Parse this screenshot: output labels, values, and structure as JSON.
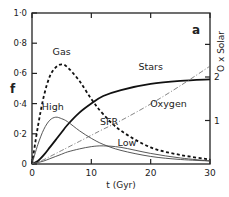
{
  "chart_data": {
    "type": "line",
    "panel_label": "a",
    "title": "",
    "xlabel": "t (Gyr)",
    "ylabel": "f",
    "y2label": "O x Solar",
    "xlim": [
      0,
      30
    ],
    "ylim": [
      0,
      1.0
    ],
    "y2lim": [
      0,
      3.2
    ],
    "x_ticks": [
      "0",
      "10",
      "20",
      "30"
    ],
    "y_ticks": [
      "0",
      "0·2",
      "0·4",
      "0·6",
      "0·8",
      "1·0"
    ],
    "y2_ticks": [
      "1",
      "2"
    ],
    "grid": false,
    "x": [
      0,
      1,
      2,
      3,
      4,
      5,
      6,
      8,
      10,
      12,
      15,
      20,
      25,
      30
    ],
    "series": [
      {
        "name": "Gas",
        "axis": "left",
        "style": "dashed-thick",
        "values": [
          0,
          0.25,
          0.45,
          0.58,
          0.64,
          0.66,
          0.64,
          0.55,
          0.43,
          0.33,
          0.22,
          0.11,
          0.06,
          0.03
        ]
      },
      {
        "name": "Stars",
        "axis": "left",
        "style": "solid-thick",
        "values": [
          0,
          0.02,
          0.06,
          0.11,
          0.16,
          0.21,
          0.26,
          0.34,
          0.4,
          0.45,
          0.49,
          0.53,
          0.55,
          0.56
        ]
      },
      {
        "name": "High",
        "axis": "left",
        "style": "solid-thin",
        "values": [
          0,
          0.13,
          0.23,
          0.29,
          0.31,
          0.3,
          0.28,
          0.22,
          0.17,
          0.13,
          0.09,
          0.05,
          0.03,
          0.02
        ]
      },
      {
        "name": "Low",
        "axis": "left",
        "style": "solid-thin",
        "values": [
          0,
          0.01,
          0.02,
          0.035,
          0.05,
          0.065,
          0.08,
          0.1,
          0.115,
          0.12,
          0.11,
          0.07,
          0.04,
          0.02
        ]
      },
      {
        "name": "Oxygen",
        "axis": "right",
        "style": "dash-dot",
        "values": [
          0,
          0.05,
          0.1,
          0.17,
          0.24,
          0.31,
          0.38,
          0.52,
          0.66,
          0.8,
          1.0,
          1.38,
          1.8,
          2.25
        ]
      }
    ],
    "annotations": [
      {
        "text": "Gas",
        "x": 5,
        "y": 0.72
      },
      {
        "text": "Stars",
        "x": 20,
        "y": 0.62
      },
      {
        "text": "Oxygen",
        "x": 23,
        "y": 0.38
      },
      {
        "text": "High",
        "x": 3.5,
        "y": 0.36
      },
      {
        "text": "SFR",
        "x": 13,
        "y": 0.26
      },
      {
        "text": "Low",
        "x": 16,
        "y": 0.12
      }
    ]
  }
}
